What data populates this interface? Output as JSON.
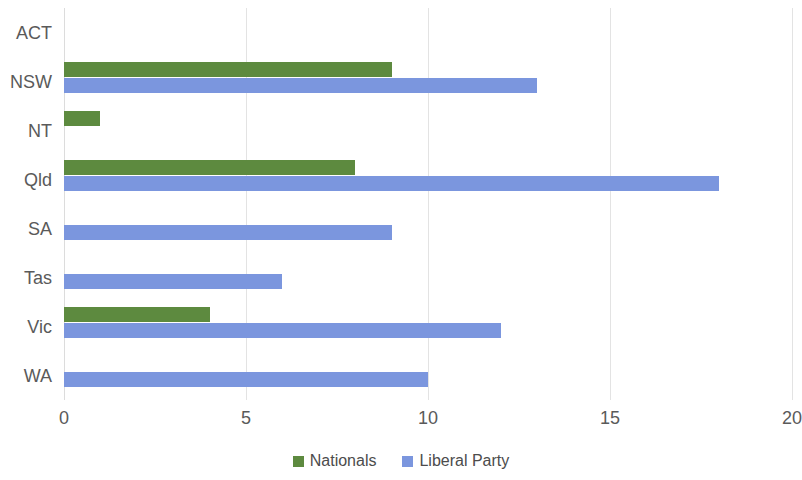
{
  "chart_data": {
    "type": "bar",
    "orientation": "horizontal",
    "title": "",
    "subtitle": "",
    "xlabel": "",
    "ylabel": "",
    "xlim": [
      0,
      20
    ],
    "xticks": [
      "0",
      "5",
      "10",
      "15",
      "20"
    ],
    "xtick_values": [
      0,
      5,
      10,
      15,
      20
    ],
    "grid": true,
    "grid_axis": "x",
    "legend_position": "bottom",
    "categories": [
      "ACT",
      "NSW",
      "NT",
      "Qld",
      "SA",
      "Tas",
      "Vic",
      "WA"
    ],
    "series": [
      {
        "name": "Nationals",
        "color": "#5d8a3f",
        "values": [
          0,
          9,
          1,
          8,
          0,
          0,
          4,
          0
        ]
      },
      {
        "name": "Liberal Party",
        "color": "#7b96de",
        "values": [
          0,
          13,
          0,
          18,
          9,
          6,
          12,
          10
        ]
      }
    ]
  },
  "legend": {
    "items": [
      {
        "label": "Nationals",
        "color": "#5d8a3f"
      },
      {
        "label": "Liberal Party",
        "color": "#7b96de"
      }
    ]
  }
}
